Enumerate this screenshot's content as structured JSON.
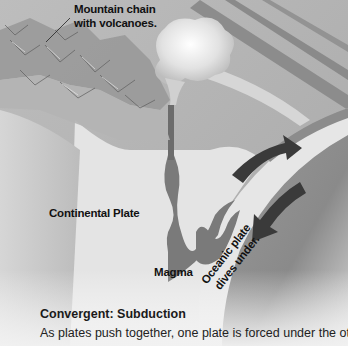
{
  "figure": {
    "title": "Convergent: Subduction",
    "description": "As plates push together, one plate is forced under the other",
    "labels": {
      "mountain_chain": "Mountain chain with volcanoes.",
      "mountain_chain_line1": "Mountain chain",
      "mountain_chain_line2": "with volcanoes.",
      "continental_plate": "Continental Plate",
      "magma": "Magma",
      "oceanic_plate_line1": "Oceanic plate",
      "oceanic_plate_line2": "dives under."
    },
    "arrows": [
      {
        "name": "upward-convection-arrow",
        "direction": "up-right"
      },
      {
        "name": "subduction-arrow",
        "direction": "down-left"
      }
    ],
    "colors": {
      "background": "#c9c9c9",
      "continental_crust": "#e4e4e4",
      "magma": "#7a7a7a",
      "oceanic_plate": "#e6e6e6",
      "mantle": "#8e8e8e",
      "arrows": "#3a3a3a",
      "text": "#111111"
    }
  }
}
